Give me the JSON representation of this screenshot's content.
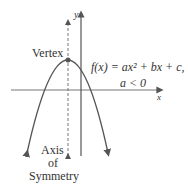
{
  "diagram": {
    "type": "parabola-graph",
    "labels": {
      "y_axis": "y",
      "x_axis": "x",
      "vertex": "Vertex",
      "function_line1": "f(x) = ax² + bx + c,",
      "function_line2": "a < 0",
      "axis_line1": "Axis",
      "axis_line2": "of",
      "axis_line3": "Symmetry"
    },
    "colors": {
      "curve": "#555555",
      "axes": "#555555",
      "text": "#333333",
      "vertex_point": "#555555"
    },
    "geometry": {
      "vertex": [
        68,
        60
      ],
      "x_axis_y": 90,
      "y_axis_x": 81,
      "symmetry_x": 68,
      "opens": "down"
    }
  }
}
